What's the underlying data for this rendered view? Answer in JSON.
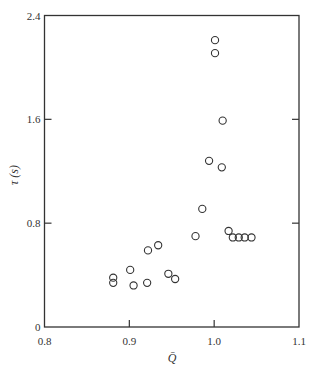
{
  "chart_data": {
    "type": "scatter",
    "title": "",
    "xlabel": "Q̄",
    "ylabel": "τ (s)",
    "xlim": [
      0.8,
      1.1
    ],
    "ylim": [
      0,
      2.4
    ],
    "xticks": [
      0.8,
      0.9,
      1.0,
      1.1
    ],
    "xtick_labels": [
      "0.8",
      "0.9",
      "1.0",
      "1.1"
    ],
    "yticks": [
      0,
      0.8,
      1.6,
      2.4
    ],
    "ytick_labels": [
      "0",
      "0.8",
      "1.6",
      "2.4"
    ],
    "grid": false,
    "legend": null,
    "marker": "open-circle",
    "series": [
      {
        "name": "data",
        "points": [
          {
            "x": 0.881,
            "y": 0.38
          },
          {
            "x": 0.881,
            "y": 0.34
          },
          {
            "x": 0.901,
            "y": 0.44
          },
          {
            "x": 0.905,
            "y": 0.32
          },
          {
            "x": 0.921,
            "y": 0.34
          },
          {
            "x": 0.922,
            "y": 0.59
          },
          {
            "x": 0.934,
            "y": 0.63
          },
          {
            "x": 0.946,
            "y": 0.41
          },
          {
            "x": 0.954,
            "y": 0.37
          },
          {
            "x": 0.978,
            "y": 0.7
          },
          {
            "x": 0.986,
            "y": 0.91
          },
          {
            "x": 0.994,
            "y": 1.28
          },
          {
            "x": 1.001,
            "y": 2.21
          },
          {
            "x": 1.001,
            "y": 2.11
          },
          {
            "x": 1.01,
            "y": 1.59
          },
          {
            "x": 1.009,
            "y": 1.23
          },
          {
            "x": 1.017,
            "y": 0.74
          },
          {
            "x": 1.022,
            "y": 0.69
          },
          {
            "x": 1.029,
            "y": 0.69
          },
          {
            "x": 1.036,
            "y": 0.69
          },
          {
            "x": 1.044,
            "y": 0.69
          }
        ]
      }
    ]
  },
  "colors": {
    "axis": "#333333",
    "marker_stroke": "#333333",
    "background": "#ffffff"
  }
}
